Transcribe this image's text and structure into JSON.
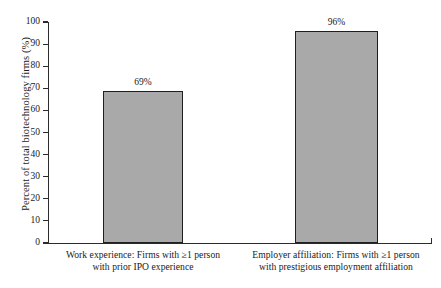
{
  "chart_data": {
    "type": "bar",
    "title": "",
    "subtitle": "",
    "xlabel": "",
    "ylabel": "Percent of total biotechnology firms (%)",
    "ylim": [
      0,
      100
    ],
    "yticks": [
      0,
      10,
      20,
      30,
      40,
      50,
      60,
      70,
      80,
      90,
      100
    ],
    "ytick_labels": [
      "0",
      "10",
      "20",
      "30",
      "40",
      "50",
      "60",
      "70",
      "80",
      "90",
      "100"
    ],
    "grid": false,
    "legend": null,
    "categories": [
      "Work experience:  Firms with ≥1 person with prior IPO experience",
      "Employer affiliation:  Firms with ≥1 person with prestigious employment affiliation"
    ],
    "category_lines": [
      [
        "Work experience:  Firms with ≥1 person",
        "with prior IPO experience"
      ],
      [
        "Employer affiliation:  Firms with ≥1 person",
        "with prestigious employment affiliation"
      ]
    ],
    "values": [
      69,
      96
    ],
    "value_labels": [
      "69%",
      "96%"
    ],
    "bar_fill": "#a9a9a9",
    "bar_edge": "#1f1f1f",
    "axis_color": "#2b2b2b",
    "background": "#ffffff"
  }
}
